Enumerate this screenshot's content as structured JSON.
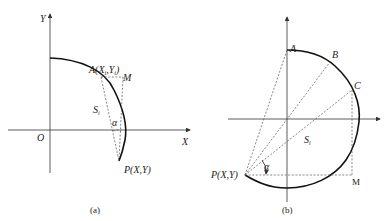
{
  "panel_a": {
    "caption": "(a)",
    "axis_x_label": "X",
    "axis_y_label": "Y",
    "origin_label": "O",
    "point_A_label": "A(X",
    "point_A_sub": "i",
    "point_A_rest": ",Y",
    "point_A_close": ")",
    "point_M_label": "M",
    "point_P_label": "P(X,Y)",
    "arc_label": "S",
    "arc_label_sub": "i",
    "angle_label": "α"
  },
  "panel_b": {
    "caption": "(b)",
    "point_A_label": "A",
    "point_B_label": "B",
    "point_C_label": "C",
    "point_M_label": "M",
    "point_P_label": "P(X,Y)",
    "area_label": "S",
    "area_label_sub": "i",
    "angle_label": "α"
  }
}
